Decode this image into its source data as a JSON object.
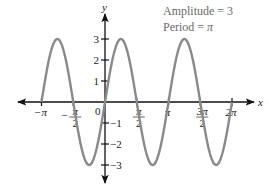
{
  "chart_data": {
    "type": "line",
    "function": "y = 3 sin(2x)",
    "title": "",
    "xlabel": "x",
    "ylabel": "y",
    "xlim_pi": [
      -1,
      2
    ],
    "ylim": [
      -3,
      3
    ],
    "x_ticks": [
      {
        "value_pi": -1,
        "num": "−π",
        "den": ""
      },
      {
        "value_pi": -0.5,
        "num": "π",
        "den": "2",
        "neg": true
      },
      {
        "value_pi": 0.5,
        "num": "π",
        "den": "2"
      },
      {
        "value_pi": 1,
        "num": "π",
        "den": ""
      },
      {
        "value_pi": 1.5,
        "num": "3π",
        "den": "2"
      },
      {
        "value_pi": 2,
        "num": "2π",
        "den": ""
      }
    ],
    "y_ticks": [
      3,
      2,
      1,
      -1,
      -2,
      -3
    ],
    "origin_label": "0",
    "series": [
      {
        "name": "3 sin 2x",
        "color": "#8a8a8a",
        "amplitude": 3,
        "period_pi": 1,
        "x_pi": [
          -1,
          -0.75,
          -0.5,
          -0.25,
          0,
          0.25,
          0.5,
          0.75,
          1,
          1.25,
          1.5,
          1.75,
          2
        ],
        "y": [
          0,
          3,
          0,
          -3,
          0,
          3,
          0,
          -3,
          0,
          3,
          0,
          -3,
          0
        ]
      }
    ],
    "annotations": [
      "Amplitude = 3",
      "Period = π"
    ],
    "grid": false,
    "legend": "none"
  },
  "annotation": {
    "amplitude_text": "Amplitude = 3",
    "period_prefix": "Period = ",
    "period_symbol": "π"
  },
  "axes": {
    "x_label": "x",
    "y_label": "y",
    "origin": "0"
  },
  "colors": {
    "curve": "#8a8a8a",
    "axis": "#111111",
    "annotation": "#6b6b6b"
  }
}
